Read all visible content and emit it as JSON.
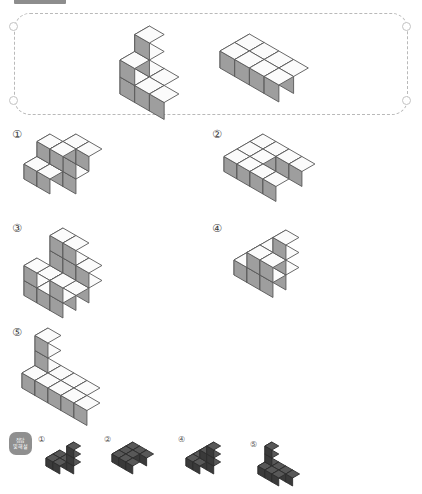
{
  "page": {
    "width": 422,
    "height": 494,
    "background": "#ffffff",
    "topbar_color": "#8d8d8d"
  },
  "colors": {
    "cube_top": "#fbfbfb",
    "cube_left": "#e3e3e3",
    "cube_right": "#9e9e9e",
    "cube_outline": "#585858",
    "dark_top": "#585858",
    "dark_left": "#4a4a4a",
    "dark_right": "#3a3a3a",
    "frame_dash": "#b9b9b9",
    "badge_bg": "#8f8f8f",
    "label_text": "#3a3a3a"
  },
  "prompt_box": {
    "name": "prompt-figures-frame",
    "border_style": "dashed",
    "corner_holes": 4,
    "figures": [
      {
        "id": "prompt-figure-left",
        "label": ""
      },
      {
        "id": "prompt-figure-right",
        "label": ""
      }
    ]
  },
  "options": [
    {
      "num": "①",
      "name": "option-1"
    },
    {
      "num": "②",
      "name": "option-2"
    },
    {
      "num": "③",
      "name": "option-3"
    },
    {
      "num": "④",
      "name": "option-4"
    },
    {
      "num": "⑤",
      "name": "option-5"
    }
  ],
  "answer_key": {
    "badge_line1": "정답",
    "badge_line2": "및해설",
    "items": [
      {
        "num": "①",
        "name": "answer-thumb-1"
      },
      {
        "num": "②",
        "name": "answer-thumb-2"
      },
      {
        "num": "④",
        "name": "answer-thumb-4"
      },
      {
        "num": "⑤",
        "name": "answer-thumb-5"
      }
    ]
  },
  "figures": {
    "prompt_left": [
      [
        0,
        0,
        0
      ],
      [
        1,
        0,
        0
      ],
      [
        0,
        1,
        0
      ],
      [
        1,
        1,
        0
      ],
      [
        2,
        1,
        0
      ],
      [
        0,
        0,
        1
      ],
      [
        0,
        1,
        1
      ],
      [
        0,
        0,
        2
      ]
    ],
    "prompt_right": [
      [
        0,
        0,
        0
      ],
      [
        1,
        0,
        0
      ],
      [
        2,
        0,
        0
      ],
      [
        0,
        1,
        0
      ],
      [
        1,
        1,
        0
      ],
      [
        2,
        1,
        0
      ],
      [
        3,
        1,
        0
      ],
      [
        3,
        0,
        0
      ]
    ],
    "opt1": [
      [
        0,
        0,
        0
      ],
      [
        1,
        0,
        0
      ],
      [
        0,
        1,
        0
      ],
      [
        1,
        1,
        0
      ],
      [
        2,
        0,
        0
      ],
      [
        2,
        0,
        1
      ],
      [
        2,
        0,
        2
      ],
      [
        0,
        0,
        1
      ],
      [
        1,
        0,
        1
      ],
      [
        2,
        1,
        2
      ],
      [
        3,
        0,
        2
      ]
    ],
    "opt2": [
      [
        0,
        0,
        0
      ],
      [
        0,
        1,
        0
      ],
      [
        0,
        2,
        0
      ],
      [
        1,
        0,
        0
      ],
      [
        1,
        1,
        0
      ],
      [
        1,
        2,
        0
      ],
      [
        2,
        0,
        0
      ],
      [
        2,
        2,
        0
      ],
      [
        3,
        0,
        0
      ],
      [
        3,
        2,
        0
      ]
    ],
    "opt3": [
      [
        0,
        0,
        0
      ],
      [
        1,
        0,
        0
      ],
      [
        2,
        0,
        0
      ],
      [
        0,
        1,
        0
      ],
      [
        1,
        1,
        0
      ],
      [
        2,
        1,
        0
      ],
      [
        0,
        2,
        0
      ],
      [
        1,
        2,
        0
      ],
      [
        2,
        2,
        0
      ],
      [
        0,
        0,
        1
      ],
      [
        1,
        0,
        1
      ],
      [
        2,
        0,
        1
      ],
      [
        0,
        2,
        1
      ],
      [
        2,
        2,
        1
      ],
      [
        0,
        0,
        2
      ],
      [
        1,
        0,
        2
      ]
    ],
    "opt4": [
      [
        0,
        0,
        0
      ],
      [
        1,
        0,
        0
      ],
      [
        2,
        0,
        0
      ],
      [
        0,
        1,
        0
      ],
      [
        1,
        1,
        0
      ],
      [
        2,
        1,
        0
      ],
      [
        1,
        0,
        1
      ],
      [
        2,
        0,
        1
      ],
      [
        1,
        1,
        1
      ],
      [
        2,
        1,
        1
      ],
      [
        2,
        0,
        2
      ]
    ],
    "opt5": [
      [
        0,
        0,
        0
      ],
      [
        1,
        0,
        0
      ],
      [
        2,
        0,
        0
      ],
      [
        3,
        0,
        0
      ],
      [
        0,
        1,
        0
      ],
      [
        1,
        1,
        0
      ],
      [
        2,
        1,
        0
      ],
      [
        3,
        1,
        0
      ],
      [
        4,
        1,
        0
      ],
      [
        0,
        0,
        1
      ],
      [
        0,
        0,
        2
      ]
    ],
    "key1": [
      [
        0,
        0,
        0
      ],
      [
        1,
        0,
        0
      ],
      [
        0,
        1,
        0
      ],
      [
        1,
        1,
        0
      ],
      [
        2,
        0,
        0
      ],
      [
        2,
        0,
        1
      ],
      [
        2,
        0,
        2
      ]
    ],
    "key2": [
      [
        0,
        0,
        0
      ],
      [
        0,
        1,
        0
      ],
      [
        0,
        2,
        0
      ],
      [
        1,
        0,
        0
      ],
      [
        1,
        1,
        0
      ],
      [
        1,
        2,
        0
      ],
      [
        2,
        0,
        0
      ],
      [
        2,
        2,
        0
      ]
    ],
    "key4": [
      [
        0,
        0,
        0
      ],
      [
        1,
        0,
        0
      ],
      [
        2,
        0,
        0
      ],
      [
        0,
        1,
        0
      ],
      [
        1,
        1,
        0
      ],
      [
        1,
        0,
        1
      ],
      [
        2,
        0,
        1
      ],
      [
        2,
        0,
        2
      ]
    ],
    "key5": [
      [
        0,
        0,
        0
      ],
      [
        1,
        0,
        0
      ],
      [
        2,
        0,
        0
      ],
      [
        3,
        0,
        0
      ],
      [
        0,
        1,
        0
      ],
      [
        1,
        1,
        0
      ],
      [
        2,
        1,
        0
      ],
      [
        0,
        0,
        1
      ],
      [
        0,
        0,
        2
      ]
    ]
  }
}
